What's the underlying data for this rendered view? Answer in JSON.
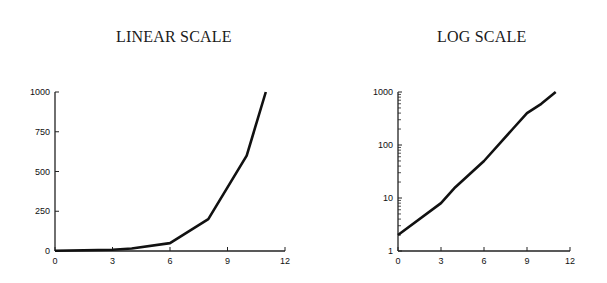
{
  "chart_data": [
    {
      "type": "line",
      "title": "LINEAR SCALE",
      "xlabel": "",
      "ylabel": "",
      "x": [
        0,
        3,
        4,
        6,
        8,
        9,
        10,
        11
      ],
      "series": [
        {
          "name": "growth",
          "values": [
            2,
            8,
            16,
            50,
            200,
            400,
            600,
            1000
          ]
        }
      ],
      "xlim": [
        0,
        12
      ],
      "ylim": [
        0,
        1000
      ],
      "xticks": [
        "0",
        "3",
        "6",
        "9",
        "12"
      ],
      "yticks": [
        "0",
        "250",
        "500",
        "750",
        "1000"
      ],
      "yscale": "linear",
      "grid": false,
      "legend": null
    },
    {
      "type": "line",
      "title": "LOG SCALE",
      "xlabel": "",
      "ylabel": "",
      "x": [
        0,
        3,
        4,
        6,
        8,
        9,
        10,
        11
      ],
      "series": [
        {
          "name": "growth",
          "values": [
            2,
            8,
            16,
            50,
            200,
            400,
            600,
            1000
          ]
        }
      ],
      "xlim": [
        0,
        12
      ],
      "ylim": [
        1,
        1000
      ],
      "xticks": [
        "0",
        "3",
        "6",
        "9",
        "12"
      ],
      "yticks": [
        "1",
        "10",
        "100",
        "1000"
      ],
      "yscale": "log",
      "grid": false,
      "legend": null
    }
  ],
  "titles": {
    "left": "LINEAR SCALE",
    "right": "LOG SCALE"
  }
}
